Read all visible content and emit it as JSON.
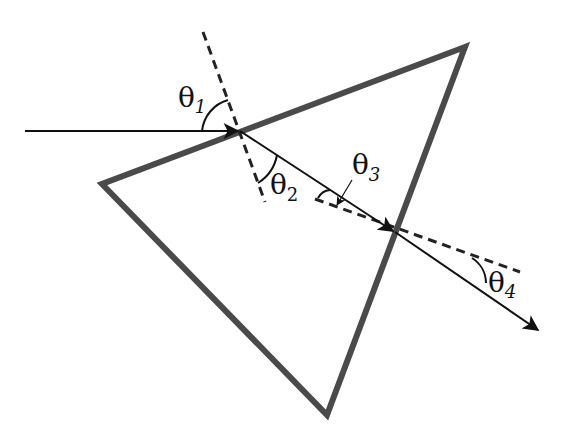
{
  "diagram": {
    "colors": {
      "prism": "#4a4a4a",
      "ray": "#111111",
      "normal": "#222222",
      "background": "#ffffff"
    },
    "prism": {
      "vertices": [
        [
          465,
          47
        ],
        [
          102,
          184
        ],
        [
          327,
          415
        ]
      ]
    },
    "labels": {
      "theta1": {
        "symbol": "θ",
        "subscript": "1"
      },
      "theta2": {
        "symbol": "θ",
        "subscript": "2"
      },
      "theta3": {
        "symbol": "θ",
        "subscript": "3"
      },
      "theta4": {
        "symbol": "θ",
        "subscript": "4"
      }
    }
  }
}
